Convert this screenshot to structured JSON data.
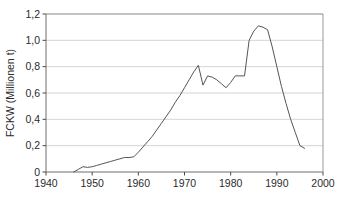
{
  "chart_data": {
    "type": "line",
    "title": "",
    "subtitle": "",
    "xlabel": "",
    "ylabel": "FCKW (Millionen t)",
    "xlim": [
      1940,
      2000
    ],
    "ylim": [
      0,
      1.2
    ],
    "grid": true,
    "legend": null,
    "x_ticks": [
      "1940",
      "1950",
      "1960",
      "1970",
      "1980",
      "1990",
      "2000"
    ],
    "x_tick_values": [
      1940,
      1950,
      1960,
      1970,
      1980,
      1990,
      2000
    ],
    "y_ticks": [
      "0",
      "0,2",
      "0,4",
      "0,6",
      "0,8",
      "1,0",
      "1,2"
    ],
    "y_tick_values": [
      0,
      0.2,
      0.4,
      0.6,
      0.8,
      1.0,
      1.2
    ],
    "series": [
      {
        "name": "FCKW",
        "color": "#555555",
        "x": [
          1946,
          1947,
          1948,
          1949,
          1950,
          1951,
          1952,
          1953,
          1954,
          1955,
          1956,
          1957,
          1958,
          1959,
          1960,
          1961,
          1962,
          1963,
          1964,
          1965,
          1966,
          1967,
          1968,
          1969,
          1970,
          1971,
          1972,
          1973,
          1974,
          1975,
          1976,
          1977,
          1978,
          1979,
          1980,
          1981,
          1982,
          1983,
          1984,
          1985,
          1986,
          1987,
          1988,
          1989,
          1990,
          1991,
          1992,
          1993,
          1994,
          1995,
          1996
        ],
        "values": [
          0.0,
          0.02,
          0.04,
          0.035,
          0.04,
          0.05,
          0.06,
          0.07,
          0.08,
          0.09,
          0.1,
          0.11,
          0.11,
          0.115,
          0.15,
          0.19,
          0.23,
          0.27,
          0.32,
          0.37,
          0.42,
          0.47,
          0.53,
          0.58,
          0.64,
          0.7,
          0.76,
          0.81,
          0.66,
          0.73,
          0.72,
          0.7,
          0.67,
          0.64,
          0.68,
          0.73,
          0.73,
          0.73,
          1.0,
          1.07,
          1.11,
          1.1,
          1.08,
          0.95,
          0.8,
          0.65,
          0.52,
          0.4,
          0.3,
          0.2,
          0.18
        ]
      }
    ]
  },
  "axis": {
    "y_title": "FCKW (Millionen t)"
  }
}
